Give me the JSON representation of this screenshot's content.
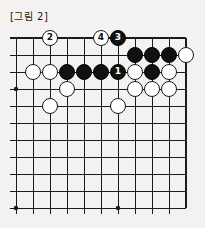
{
  "caption": "[그림 2]",
  "board": {
    "type": "go-board-diagram",
    "columns": 11,
    "rows": 11,
    "edges": {
      "top": true,
      "right": true,
      "left": false,
      "bottom": false
    },
    "line_color": "#1a1a1a",
    "black_color": "#111111",
    "white_color": "#ffffff",
    "origin_x": 16,
    "origin_y": 38,
    "step": 17,
    "stone_radius": 8.2,
    "star_points": [
      {
        "col": 0,
        "row": 3
      },
      {
        "col": 0,
        "row": 10
      },
      {
        "col": 6,
        "row": 10
      }
    ],
    "stones": [
      {
        "col": 2,
        "row": 0,
        "color": "white",
        "label": "2"
      },
      {
        "col": 5,
        "row": 0,
        "color": "white",
        "label": "4"
      },
      {
        "col": 6,
        "row": 0,
        "color": "black",
        "label": "3"
      },
      {
        "col": 7,
        "row": 1,
        "color": "black",
        "label": ""
      },
      {
        "col": 8,
        "row": 1,
        "color": "black",
        "label": ""
      },
      {
        "col": 9,
        "row": 1,
        "color": "black",
        "label": ""
      },
      {
        "col": 10,
        "row": 1,
        "color": "white",
        "label": ""
      },
      {
        "col": 1,
        "row": 2,
        "color": "white",
        "label": ""
      },
      {
        "col": 2,
        "row": 2,
        "color": "white",
        "label": ""
      },
      {
        "col": 3,
        "row": 2,
        "color": "black",
        "label": ""
      },
      {
        "col": 4,
        "row": 2,
        "color": "black",
        "label": ""
      },
      {
        "col": 5,
        "row": 2,
        "color": "black",
        "label": ""
      },
      {
        "col": 6,
        "row": 2,
        "color": "black",
        "label": "1"
      },
      {
        "col": 7,
        "row": 2,
        "color": "white",
        "label": ""
      },
      {
        "col": 8,
        "row": 2,
        "color": "black",
        "label": ""
      },
      {
        "col": 9,
        "row": 2,
        "color": "white",
        "label": ""
      },
      {
        "col": 3,
        "row": 3,
        "color": "white",
        "label": ""
      },
      {
        "col": 7,
        "row": 3,
        "color": "white",
        "label": ""
      },
      {
        "col": 8,
        "row": 3,
        "color": "white",
        "label": ""
      },
      {
        "col": 9,
        "row": 3,
        "color": "white",
        "label": ""
      },
      {
        "col": 2,
        "row": 4,
        "color": "white",
        "label": ""
      },
      {
        "col": 6,
        "row": 4,
        "color": "white",
        "label": ""
      }
    ]
  }
}
